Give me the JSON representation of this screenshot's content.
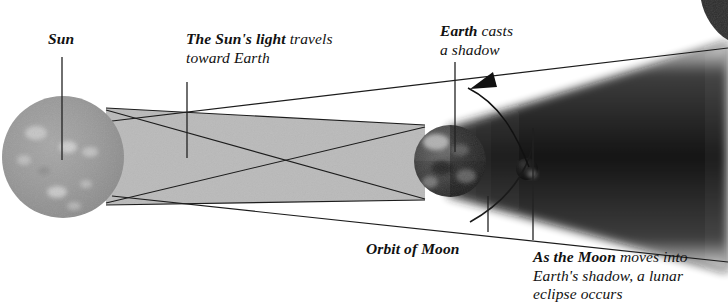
{
  "diagram": {
    "background_color": "#ffffff",
    "labels": {
      "sun": {
        "bold": "Sun",
        "rest": ""
      },
      "sun_light": {
        "bold": "The Sun's light",
        "rest": " travels",
        "line2": "toward Earth"
      },
      "earth_casts": {
        "bold": "Earth",
        "rest": " casts",
        "line2": "a shadow"
      },
      "orbit_of_moon": {
        "bold": "Orbit of Moon",
        "rest": ""
      },
      "lunar_eclipse": {
        "bold": "As the Moon",
        "rest": " moves into",
        "line2": "Earth's shadow, a lunar",
        "line3": "eclipse occurs"
      }
    },
    "bodies": {
      "sun": {
        "name": "Sun",
        "cx": 63,
        "cy": 157,
        "r": 61,
        "fill": "#9a9a9a"
      },
      "earth": {
        "name": "Earth",
        "cx": 450,
        "cy": 161,
        "r": 36,
        "fill": "#4a4a4a"
      },
      "moon": {
        "name": "Moon",
        "cx": 527,
        "cy": 169,
        "r": 11,
        "fill": "#151515"
      }
    },
    "colors": {
      "light_beam": "#b4b4b4",
      "shadow_cone": "#101010",
      "ray_line": "#1a1a1a",
      "leader_line": "#2a2a2a",
      "sun_body": "#9a9a9a",
      "earth_body": "#4a4a4a",
      "moon_body": "#151515"
    },
    "elements": {
      "light_beam_note": "grey tapering band from Sun tangents to Earth tangents",
      "shadow_cone_note": "dark cone widening rightward from Earth to right edge",
      "orbit_arc_note": "arc of Moon orbit curving through the Moon",
      "arrow_note": "curved arrow from Moon up-left to Earth casts a shadow label"
    }
  }
}
